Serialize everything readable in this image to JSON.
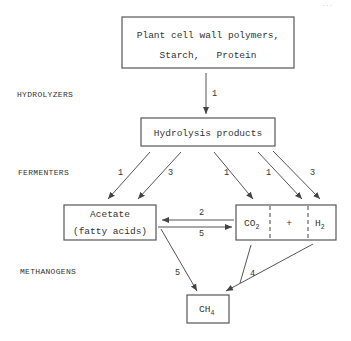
{
  "diagram": {
    "top_right_fragment": "...",
    "stage_labels": {
      "hydrolyzers": "HYDROLYZERS",
      "fermenters": "FERMENTERS",
      "methanogens": "METHANOGENS"
    },
    "nodes": {
      "polymers": {
        "line1": "Plant cell wall polymers,",
        "line2": "Starch,   Protein"
      },
      "hydrolysis": {
        "label": "Hydrolysis products"
      },
      "acetate": {
        "line1": "Acetate",
        "line2": "(fatty acids)"
      },
      "co2_h2": {
        "co2_base": "CO",
        "co2_sub": "2",
        "plus": "+",
        "h2_base": "H",
        "h2_sub": "2"
      },
      "ch4": {
        "base": "CH",
        "sub": "4"
      }
    },
    "edges": [
      {
        "from": "polymers",
        "to": "hydrolysis",
        "label": "1"
      },
      {
        "from": "hydrolysis",
        "to": "acetate",
        "label": "1"
      },
      {
        "from": "hydrolysis",
        "to": "acetate",
        "label": "3"
      },
      {
        "from": "hydrolysis",
        "to": "co2",
        "label": "1"
      },
      {
        "from": "hydrolysis",
        "to": "h2",
        "label": "1"
      },
      {
        "from": "hydrolysis",
        "to": "h2",
        "label": "3"
      },
      {
        "from": "co2_h2",
        "to": "acetate",
        "label": "2"
      },
      {
        "from": "acetate",
        "to": "co2_h2",
        "label": "5"
      },
      {
        "from": "acetate",
        "to": "ch4",
        "label": "5"
      },
      {
        "from": "co2_h2",
        "to": "ch4",
        "label": "4"
      }
    ],
    "colors": {
      "ink": "#555555",
      "text": "#333333",
      "background": "#ffffff"
    }
  }
}
